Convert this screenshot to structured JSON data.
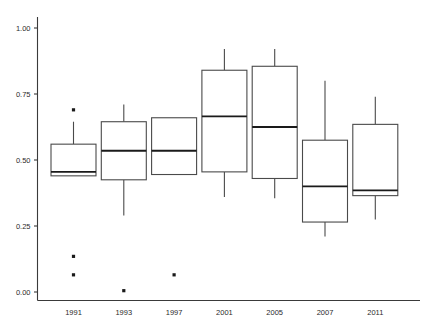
{
  "chart_data": {
    "type": "box",
    "title": "",
    "xlabel": "",
    "ylabel": "",
    "categories": [
      "1991",
      "1993",
      "1997",
      "2001",
      "2005",
      "2007",
      "2011"
    ],
    "ylim": [
      0.0,
      1.0
    ],
    "yticks": [
      0.0,
      0.25,
      0.5,
      0.75,
      1.0
    ],
    "ytick_labels": [
      "0.00",
      "0.25",
      "0.50",
      "0.75",
      "1.00"
    ],
    "grid": false,
    "legend": "none",
    "boxes": [
      {
        "category": "1991",
        "whisker_low": 0.44,
        "q1": 0.44,
        "median": 0.455,
        "q3": 0.56,
        "whisker_high": 0.645,
        "outliers": [
          0.69,
          0.135,
          0.065
        ]
      },
      {
        "category": "1993",
        "whisker_low": 0.29,
        "q1": 0.425,
        "median": 0.535,
        "q3": 0.645,
        "whisker_high": 0.71,
        "outliers": [
          0.005
        ]
      },
      {
        "category": "1997",
        "whisker_low": 0.445,
        "q1": 0.445,
        "median": 0.535,
        "q3": 0.66,
        "whisker_high": 0.66,
        "outliers": [
          0.065
        ]
      },
      {
        "category": "2001",
        "whisker_low": 0.36,
        "q1": 0.455,
        "median": 0.665,
        "q3": 0.84,
        "whisker_high": 0.92,
        "outliers": []
      },
      {
        "category": "2005",
        "whisker_low": 0.355,
        "q1": 0.43,
        "median": 0.625,
        "q3": 0.855,
        "whisker_high": 0.92,
        "outliers": []
      },
      {
        "category": "2007",
        "whisker_low": 0.21,
        "q1": 0.265,
        "median": 0.4,
        "q3": 0.575,
        "whisker_high": 0.8,
        "outliers": []
      },
      {
        "category": "2011",
        "whisker_low": 0.275,
        "q1": 0.365,
        "median": 0.385,
        "q3": 0.635,
        "whisker_high": 0.74,
        "outliers": []
      }
    ]
  },
  "colors": {
    "background": "#ffffff",
    "box_stroke": "#4a4a4a",
    "median_stroke": "#1a1a1a",
    "axis": "#3a3a3a",
    "outlier": "#1a1a1a",
    "tick_text": "#2b2b2b"
  }
}
